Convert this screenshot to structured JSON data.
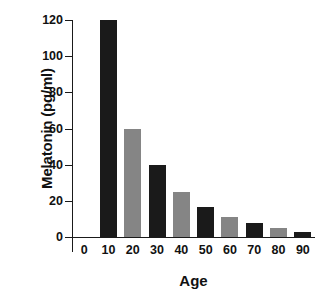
{
  "chart_data": {
    "type": "bar",
    "title": "",
    "xlabel": "Age",
    "ylabel": "Melatonin (pg/ml)",
    "categories": [
      "0",
      "10",
      "20",
      "30",
      "40",
      "50",
      "60",
      "70",
      "80",
      "90"
    ],
    "x_tick_labels": [
      "0",
      "10",
      "20",
      "30",
      "40",
      "50",
      "60",
      "70",
      "80",
      "90"
    ],
    "y_tick_labels": [
      "0",
      "20",
      "40",
      "60",
      "80",
      "100",
      "120"
    ],
    "y_ticks": [
      0,
      20,
      40,
      60,
      80,
      100,
      120
    ],
    "ylim": [
      0,
      120
    ],
    "grid": false,
    "legend": "none",
    "bar_colors": [
      "#1a1a1a",
      "#858585"
    ],
    "bars": [
      {
        "category": "0",
        "value": null,
        "color": null
      },
      {
        "category": "10",
        "value": 120,
        "color": "#1a1a1a"
      },
      {
        "category": "20",
        "value": 60,
        "color": "#858585"
      },
      {
        "category": "30",
        "value": 40,
        "color": "#1a1a1a"
      },
      {
        "category": "40",
        "value": 25,
        "color": "#858585"
      },
      {
        "category": "50",
        "value": 16.5,
        "color": "#1a1a1a"
      },
      {
        "category": "60",
        "value": 11,
        "color": "#858585"
      },
      {
        "category": "70",
        "value": 8,
        "color": "#1a1a1a"
      },
      {
        "category": "80",
        "value": 5,
        "color": "#858585"
      },
      {
        "category": "90",
        "value": 2.5,
        "color": "#1a1a1a"
      }
    ],
    "values": [
      null,
      120,
      60,
      40,
      25,
      16.5,
      11,
      8,
      5,
      2.5
    ]
  }
}
